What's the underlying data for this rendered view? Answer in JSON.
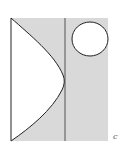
{
  "figure": {
    "label": "c",
    "colors": {
      "background": "#ffffff",
      "shaded_region": "#d9d9d9",
      "stroke": "#222222",
      "inner_fill": "#ffffff"
    },
    "shapes": [
      {
        "name": "shaded-rectangle",
        "x": 11,
        "y": 18,
        "width": 97,
        "height": 123
      },
      {
        "name": "vertical-divider-line",
        "x": 65,
        "y1": 18,
        "y2": 141
      },
      {
        "name": "parabolic-white-region",
        "apex_x": 64,
        "apex_y": 80
      },
      {
        "name": "white-circle",
        "cx": 90,
        "cy": 39,
        "r": 18
      }
    ]
  }
}
